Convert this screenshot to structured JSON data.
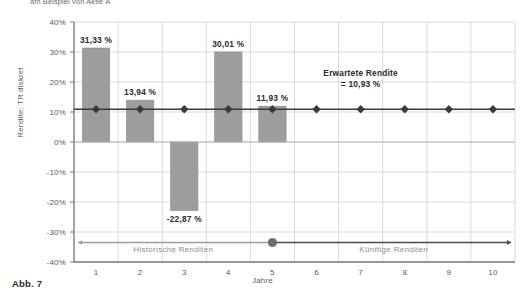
{
  "figure": {
    "top_caption": "am Beispiel von Aktie A",
    "caption_label": "Abb. 7"
  },
  "chart_data": {
    "type": "bar",
    "title": "",
    "subtitle": "am Beispiel von Aktie A",
    "xlabel": "Jahre",
    "ylabel": "Rendite: TR diskret",
    "categories": [
      "1",
      "2",
      "3",
      "4",
      "5",
      "6",
      "7",
      "8",
      "9",
      "10"
    ],
    "xlim": [
      0.5,
      10.5
    ],
    "ylim": [
      -40,
      40
    ],
    "yticks": [
      40,
      30,
      20,
      10,
      0,
      -10,
      -20,
      -30,
      -40
    ],
    "ytick_labels": [
      "40%",
      "30%",
      "20%",
      "10%",
      "0%",
      "-10%",
      "-20%",
      "-30%",
      "-40%"
    ],
    "grid": true,
    "legend_position": "none",
    "series": [
      {
        "name": "Historische Renditen",
        "type": "bar",
        "color": "#9d9d9d",
        "values": [
          31.33,
          13.94,
          -22.87,
          30.01,
          11.93,
          null,
          null,
          null,
          null,
          null
        ],
        "value_labels": [
          "31,33 %",
          "13,94 %",
          "-22,87 %",
          "30,01 %",
          "11,93 %",
          "",
          "",
          "",
          "",
          ""
        ]
      },
      {
        "name": "Erwartete Rendite",
        "type": "line",
        "color": "#3a3a3a",
        "marker": "diamond",
        "constant_value": 10.93,
        "values": [
          10.93,
          10.93,
          10.93,
          10.93,
          10.93,
          10.93,
          10.93,
          10.93,
          10.93,
          10.93
        ]
      }
    ],
    "annotations": [
      {
        "name": "expected-return",
        "line1": "Erwartete Rendite",
        "line2": "= 10,93 %",
        "x": 7.0,
        "y": 22
      },
      {
        "name": "historical-band",
        "text": "Historische Renditen",
        "x": 2.75,
        "y": -36.5
      },
      {
        "name": "future-band",
        "text": "Künftige Renditen",
        "x": 7.75,
        "y": -36.5
      }
    ],
    "timeline": {
      "name": "timeline-axis",
      "y": -33.5,
      "split_at_year": 5,
      "marker": "circle"
    }
  },
  "colors": {
    "bar_fill": "#9d9d9d",
    "bar_stroke": "#8a8a8a",
    "line": "#3a3a3a",
    "grid": "#cfcfcf",
    "axis": "#7a7a7a",
    "text": "#4a4a4a",
    "muted_text": "#8d8d8d",
    "background": "#ffffff"
  }
}
